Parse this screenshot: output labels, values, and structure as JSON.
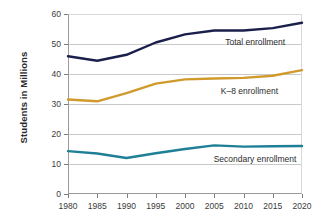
{
  "chart_data": {
    "type": "line",
    "title": "",
    "xlabel": "",
    "ylabel": "Students in Millions",
    "x": [
      1980,
      1985,
      1990,
      1995,
      2000,
      2005,
      2010,
      2015,
      2020
    ],
    "xtick_labels": [
      "1980",
      "1985",
      "1990",
      "1995",
      "2000",
      "2005",
      "2010",
      "2015",
      "2020"
    ],
    "ytick_labels": [
      "0",
      "10",
      "20",
      "30",
      "40",
      "50",
      "60"
    ],
    "yticks": [
      0,
      10,
      20,
      30,
      40,
      50,
      60
    ],
    "ylim": [
      0,
      60
    ],
    "xlim": [
      1980,
      2020
    ],
    "grid": "horizontal",
    "legend_position": "inline-right-of-series",
    "series": [
      {
        "name": "Total enrollment",
        "color": "#1b1f4b",
        "values": [
          45.9,
          44.4,
          46.4,
          50.5,
          53.2,
          54.5,
          54.5,
          55.3,
          57.1
        ]
      },
      {
        "name": "K–8 enrollment",
        "color": "#d09a2c",
        "values": [
          31.5,
          30.9,
          33.6,
          36.8,
          38.2,
          38.5,
          38.7,
          39.4,
          41.3
        ]
      },
      {
        "name": "Secondary enrollment",
        "color": "#1e7f96",
        "values": [
          14.3,
          13.5,
          12.0,
          13.6,
          15.0,
          16.2,
          15.8,
          15.9,
          16.0
        ]
      }
    ]
  },
  "axis": {
    "y_title": "Students in Millions"
  },
  "labels": {
    "total": "Total enrollment",
    "k8": "K–8 enrollment",
    "secondary": "Secondary enrollment"
  }
}
